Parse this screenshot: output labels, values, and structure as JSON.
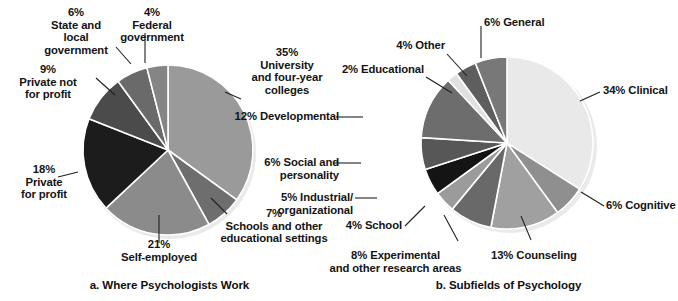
{
  "figure": {
    "background": "#ffffff",
    "slice_border_color": "#ffffff",
    "leader_line_color": "#202020",
    "text_color": "#141414"
  },
  "chart_data": [
    {
      "type": "pie",
      "id": "where-psychologists-work",
      "title": "a. Where Psychologists Work",
      "caption": "a. Where Psychologists Work",
      "start_angle_deg": 0,
      "direction": "clockwise",
      "total": 100,
      "units": "percent",
      "center": {
        "cx": 168,
        "cy": 150
      },
      "radius": 85,
      "categories": [
        "University and four-year colleges",
        "Schools and other educational settings",
        "Self-employed",
        "Private for profit",
        "Private not for profit",
        "State and local government",
        "Federal government"
      ],
      "values": [
        35,
        7,
        21,
        18,
        9,
        6,
        4
      ],
      "colors": [
        "#9a9a9a",
        "#6e6e6e",
        "#8b8b8b",
        "#1c1c1c",
        "#4b4b4b",
        "#6a6a6a",
        "#858585"
      ],
      "labels": [
        {
          "percent": "35%",
          "name": "University\nand four-year\ncolleges",
          "text": "35%\nUniversity\nand four-year\ncolleges"
        },
        {
          "percent": "7%",
          "name": "Schools and other\neducational settings",
          "text": "7%\nSchools and other\neducational settings"
        },
        {
          "percent": "21%",
          "name": "Self-employed",
          "text": "21%\nSelf-employed"
        },
        {
          "percent": "18%",
          "name": "Private\nfor profit",
          "text": "18%\nPrivate\nfor profit"
        },
        {
          "percent": "9%",
          "name": "Private not\nfor profit",
          "text": "9%\nPrivate not\nfor profit"
        },
        {
          "percent": "6%",
          "name": "State and\nlocal\ngovernment",
          "text": "6%\nState and\nlocal\ngovernment"
        },
        {
          "percent": "4%",
          "name": "Federal\ngovernment",
          "text": "4%\nFederal\ngovernment"
        }
      ]
    },
    {
      "type": "pie",
      "id": "subfields-of-psychology",
      "title": "b. Subfields of Psychology",
      "caption": "b. Subfields of Psychology",
      "start_angle_deg": 0,
      "direction": "clockwise",
      "total": 100,
      "units": "percent",
      "center": {
        "cx": 168,
        "cy": 143
      },
      "radius": 86,
      "categories": [
        "Clinical",
        "Cognitive",
        "Counseling",
        "Experimental and other research areas",
        "School",
        "Industrial/organizational",
        "Social and personality",
        "Developmental",
        "Educational",
        "Other",
        "General"
      ],
      "values": [
        34,
        6,
        13,
        8,
        4,
        5,
        6,
        12,
        2,
        4,
        6
      ],
      "colors": [
        "#e9e9e9",
        "#8f8f8f",
        "#a0a0a0",
        "#696969",
        "#9b9b9b",
        "#141414",
        "#575757",
        "#6d6d6d",
        "#e0e0e0",
        "#5e5e5e",
        "#787878"
      ],
      "labels": [
        {
          "percent": "34%",
          "name": "Clinical",
          "text": "34% Clinical"
        },
        {
          "percent": "6%",
          "name": "Cognitive",
          "text": "6% Cognitive"
        },
        {
          "percent": "13%",
          "name": "Counseling",
          "text": "13% Counseling"
        },
        {
          "percent": "8%",
          "name": "Experimental and other research areas",
          "text": "8% Experimental\nand other research areas"
        },
        {
          "percent": "4%",
          "name": "School",
          "text": "4% School"
        },
        {
          "percent": "5%",
          "name": "Industrial/organizational",
          "text": "5% Industrial/\norganizational"
        },
        {
          "percent": "6%",
          "name": "Social and personality",
          "text": "6% Social and\npersonality"
        },
        {
          "percent": "12%",
          "name": "Developmental",
          "text": "12% Developmental"
        },
        {
          "percent": "2%",
          "name": "Educational",
          "text": "2% Educational"
        },
        {
          "percent": "4%",
          "name": "Other",
          "text": "4% Other"
        },
        {
          "percent": "6%",
          "name": "General",
          "text": "6% General"
        }
      ]
    }
  ],
  "panel_a": {
    "caption": "a. Where Psychologists Work",
    "callouts": {
      "university": "35%\nUniversity\nand four-year\ncolleges",
      "schools": "7%\nSchools and other\neducational settings",
      "self_employed": "21%\nSelf-employed",
      "private_for_profit": "18%\nPrivate\nfor profit",
      "private_not_for_profit": "9%\nPrivate not\nfor profit",
      "state_local": "6%\nState and\nlocal\ngovernment",
      "federal": "4%\nFederal\ngovernment"
    }
  },
  "panel_b": {
    "caption": "b. Subfields of Psychology",
    "callouts": {
      "clinical": "34% Clinical",
      "cognitive": "6% Cognitive",
      "counseling": "13% Counseling",
      "experimental": "8% Experimental\nand other research areas",
      "school": "4% School",
      "industrial": "5% Industrial/\norganizational",
      "social": "6% Social and\npersonality",
      "developmental": "12% Developmental",
      "educational": "2% Educational",
      "other": "4% Other",
      "general": "6% General"
    }
  }
}
